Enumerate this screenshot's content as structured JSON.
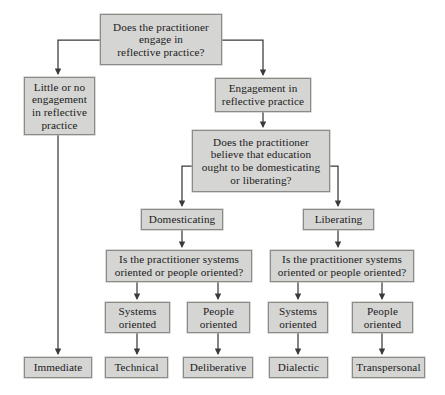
{
  "diagram": {
    "background_color": "#ffffff",
    "node_fill_color": "#d5d5d3",
    "node_border_color": "#8a8a88",
    "edge_color": "#3a3a3a",
    "nodes": {
      "root": "Does the practitioner\nengage in\nreflective practice?",
      "little_or_no": "Little or no\nengagement\nin reflective\npractice",
      "engagement": "Engagement in\nreflective practice",
      "believe": "Does the practitioner\nbelieve that education\nought to be domesticating\nor liberating?",
      "domesticating": "Domesticating",
      "liberating": "Liberating",
      "ask_left": "Is the practitioner systems\noriented or people oriented?",
      "ask_right": "Is the practitioner systems\noriented or people oriented?",
      "systems_left": "Systems\noriented",
      "people_left": "People\noriented",
      "systems_right": "Systems\noriented",
      "people_right": "People\noriented",
      "immediate": "Immediate",
      "technical": "Technical",
      "deliberative": "Deliberative",
      "dialectic": "Dialectic",
      "transpersonal": "Transpersonal"
    },
    "edges": [
      {
        "from": "root",
        "to": "little_or_no"
      },
      {
        "from": "root",
        "to": "engagement"
      },
      {
        "from": "engagement",
        "to": "believe"
      },
      {
        "from": "believe",
        "to": "domesticating"
      },
      {
        "from": "believe",
        "to": "liberating"
      },
      {
        "from": "domesticating",
        "to": "ask_left"
      },
      {
        "from": "liberating",
        "to": "ask_right"
      },
      {
        "from": "ask_left",
        "to": "systems_left"
      },
      {
        "from": "ask_left",
        "to": "people_left"
      },
      {
        "from": "ask_right",
        "to": "systems_right"
      },
      {
        "from": "ask_right",
        "to": "people_right"
      },
      {
        "from": "little_or_no",
        "to": "immediate"
      },
      {
        "from": "systems_left",
        "to": "technical"
      },
      {
        "from": "people_left",
        "to": "deliberative"
      },
      {
        "from": "systems_right",
        "to": "dialectic"
      },
      {
        "from": "people_right",
        "to": "transpersonal"
      }
    ]
  }
}
